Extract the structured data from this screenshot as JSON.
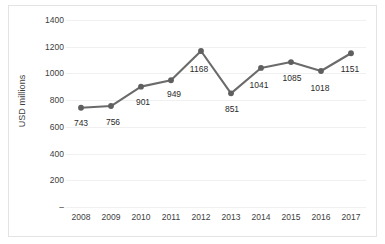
{
  "chart_data": {
    "type": "line",
    "title": "",
    "xlabel": "",
    "ylabel": "USD millions",
    "categories": [
      "2008",
      "2009",
      "2010",
      "2011",
      "2012",
      "2013",
      "2014",
      "2015",
      "2016",
      "2017"
    ],
    "values": [
      743,
      756,
      901,
      949,
      1168,
      851,
      1041,
      1085,
      1018,
      1151
    ],
    "point_labels": [
      "743",
      "756",
      "901",
      "949",
      "1168",
      "851",
      "1041",
      "1085",
      "1018",
      "1151"
    ],
    "ylim": [
      0,
      1400
    ],
    "ytick_values": [
      1400,
      1200,
      1000,
      800,
      600,
      400,
      200,
      0
    ],
    "ytick_labels": [
      "1400",
      "1200",
      "1000",
      "800",
      "600",
      "400",
      "200",
      "–"
    ],
    "grid": true,
    "legend": "none",
    "series_color": "#6b6b6b",
    "marker": "circle",
    "marker_color": "#5f5f5f",
    "grid_color": "#f0f0f0",
    "text_color": "#404040",
    "background_color": "#ffffff",
    "border_color": "#e3e3e3"
  }
}
